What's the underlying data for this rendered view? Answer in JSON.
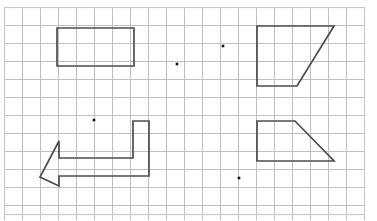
{
  "figure": {
    "title": "Grid worksheet with geometric shapes",
    "canvas": {
      "width": 377,
      "height": 220,
      "background": "#ffffff"
    },
    "grid": {
      "origin_x": 4.5,
      "origin_y": 7.5,
      "cell_size": 18,
      "cols": 20,
      "rows": 11.5,
      "line_color": "#b9b9b9",
      "line_width": 0.9,
      "border_color": "#c9c9c9",
      "border_width": 1.2
    },
    "shape_style": {
      "stroke_color": "#4d4d4d",
      "stroke_width": 1.7,
      "fill": "none",
      "line_join": "miter"
    },
    "point_style": {
      "color": "#111111",
      "size": 2.6,
      "shape": "square"
    },
    "shapes": [
      {
        "name": "rectangle",
        "label": "Rectangle",
        "type": "polygon",
        "closed": true,
        "points": "57,28 134,28 134,66 57,66"
      },
      {
        "name": "arrow",
        "label": "Left-pointing arrow",
        "type": "polygon",
        "closed": true,
        "points": "149,121 149,176 59,176 59,186 40,177 59,141 59,158 133,158 133,121"
      },
      {
        "name": "trapezoid-top-right",
        "label": "Right trapezoid (upper)",
        "type": "polygon",
        "closed": true,
        "points": "257,26 334,26 297,86 257,86"
      },
      {
        "name": "trapezoid-bottom-right",
        "label": "Right trapezoid (lower)",
        "type": "polygon",
        "closed": true,
        "points": "257,121 295,121 334,161 257,161"
      }
    ],
    "points": [
      {
        "name": "point-center-upper-right",
        "label": "Point A",
        "x": 223,
        "y": 46
      },
      {
        "name": "point-center-upper-left",
        "label": "Point B",
        "x": 177,
        "y": 64
      },
      {
        "name": "point-center-left",
        "label": "Point C",
        "x": 94,
        "y": 120
      },
      {
        "name": "point-center-lower-right",
        "label": "Point D",
        "x": 239,
        "y": 178
      }
    ]
  }
}
